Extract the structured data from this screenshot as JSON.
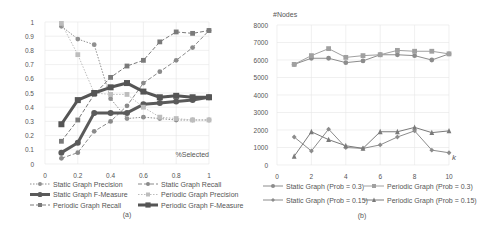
{
  "chart_data": [
    {
      "type": "line",
      "caption": "(a)",
      "title": "",
      "xlabel": "%Selected",
      "ylabel": "",
      "xlim": [
        0,
        1
      ],
      "ylim": [
        0,
        1
      ],
      "xticks": [
        "0",
        "0.2",
        "0.4",
        "0.6",
        "0.8",
        "1"
      ],
      "yticks": [
        "0",
        "0.1",
        "0.2",
        "0.3",
        "0.4",
        "0.5",
        "0.6",
        "0.7",
        "0.8",
        "0.9",
        "1"
      ],
      "grid": true,
      "legend_position": "bottom",
      "x": [
        0.1,
        0.2,
        0.3,
        0.4,
        0.5,
        0.6,
        0.7,
        0.8,
        0.9,
        1.0
      ],
      "series": [
        {
          "name": "Static Graph Precision",
          "style": "dotted",
          "color": "#909090",
          "width": 1,
          "marker": "circle",
          "values": [
            0.97,
            0.88,
            0.84,
            0.46,
            0.32,
            0.33,
            0.32,
            0.31,
            0.31,
            0.31
          ]
        },
        {
          "name": "Static Graph Recall",
          "style": "dashed",
          "color": "#8a8a8a",
          "width": 1,
          "marker": "circle",
          "values": [
            0.04,
            0.08,
            0.23,
            0.3,
            0.41,
            0.57,
            0.65,
            0.73,
            0.82,
            0.94
          ]
        },
        {
          "name": "Static Graph F-Measure",
          "style": "solid",
          "color": "#5a5a5a",
          "width": 3,
          "marker": "circle",
          "values": [
            0.08,
            0.15,
            0.36,
            0.36,
            0.36,
            0.42,
            0.43,
            0.44,
            0.45,
            0.47
          ]
        },
        {
          "name": "Periodic Graph Precision",
          "style": "dotted",
          "color": "#bdbdbd",
          "width": 1,
          "marker": "square",
          "values": [
            0.99,
            0.77,
            0.5,
            0.49,
            0.49,
            0.4,
            0.33,
            0.32,
            0.31,
            0.31
          ]
        },
        {
          "name": "Periodic Graph Recall",
          "style": "dashed",
          "color": "#7a7a7a",
          "width": 1,
          "marker": "square",
          "values": [
            0.16,
            0.31,
            0.49,
            0.61,
            0.69,
            0.73,
            0.86,
            0.93,
            0.92,
            0.94
          ]
        },
        {
          "name": "Periodic Graph F-Measure",
          "style": "solid",
          "color": "#555555",
          "width": 3,
          "marker": "square",
          "values": [
            0.28,
            0.45,
            0.5,
            0.54,
            0.57,
            0.51,
            0.47,
            0.48,
            0.47,
            0.47
          ]
        }
      ]
    },
    {
      "type": "line",
      "caption": "(b)",
      "title": "",
      "xlabel": "k",
      "ylabel": "#Nodes",
      "xlim": [
        0,
        10
      ],
      "ylim": [
        0,
        8000
      ],
      "xticks": [
        "0",
        "2",
        "4",
        "6",
        "8",
        "10"
      ],
      "yticks": [
        "0",
        "1000",
        "2000",
        "3000",
        "4000",
        "5000",
        "6000",
        "7000",
        "8000"
      ],
      "grid": true,
      "legend_position": "bottom",
      "x": [
        1,
        2,
        3,
        4,
        5,
        6,
        7,
        8,
        9,
        10
      ],
      "series": [
        {
          "name": "Static Graph (Prob = 0.3)",
          "style": "solid",
          "color": "#8c8c8c",
          "marker": "circle",
          "values": [
            5750,
            6100,
            6100,
            5850,
            5950,
            6300,
            6300,
            6250,
            6000,
            6350
          ]
        },
        {
          "name": "Periodic Graph (Prob = 0.3)",
          "style": "solid",
          "color": "#a0a0a0",
          "marker": "square",
          "values": [
            5750,
            6250,
            6650,
            6150,
            6250,
            6300,
            6550,
            6500,
            6500,
            6350
          ]
        },
        {
          "name": "Static Graph (Prob = 0.15)",
          "style": "solid",
          "color": "#8c8c8c",
          "marker": "diamond",
          "values": [
            1600,
            800,
            2050,
            1000,
            950,
            1150,
            1600,
            1950,
            850,
            700
          ]
        },
        {
          "name": "Periodic Graph (Prob = 0.15)",
          "style": "solid",
          "color": "#7a7a7a",
          "marker": "triangle",
          "values": [
            500,
            1900,
            1450,
            1100,
            950,
            1900,
            1900,
            2150,
            1850,
            1950
          ]
        }
      ]
    }
  ]
}
